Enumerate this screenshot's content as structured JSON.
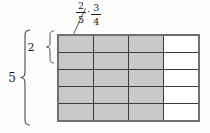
{
  "figure": {
    "expression": {
      "fraction1": {
        "numerator": "2",
        "denominator": "5"
      },
      "operator": "·",
      "fraction2": {
        "numerator": "3",
        "denominator": "4"
      }
    },
    "braces": {
      "total_rows_label": "5",
      "highlighted_rows_label": "2"
    },
    "grid": {
      "rows": 5,
      "cols": 4,
      "shaded_cols": 3,
      "shade_color": "#c9c9c9",
      "unshaded_color": "#ffffff",
      "line_color": "#3a3a3a",
      "outer_border_color": "#707070"
    },
    "stroke_color": "#4a4a4a"
  }
}
